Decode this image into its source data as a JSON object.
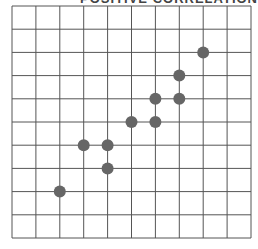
{
  "chart_data": {
    "type": "scatter",
    "title": "POSITIVE CORRELATION",
    "xlabel": "",
    "ylabel": "",
    "xlim": [
      0,
      10
    ],
    "ylim": [
      0,
      10
    ],
    "grid": true,
    "grid_divisions": 10,
    "points": [
      {
        "x": 2,
        "y": 2
      },
      {
        "x": 3,
        "y": 4
      },
      {
        "x": 4,
        "y": 4
      },
      {
        "x": 4,
        "y": 3
      },
      {
        "x": 5,
        "y": 5
      },
      {
        "x": 6,
        "y": 5
      },
      {
        "x": 6,
        "y": 6
      },
      {
        "x": 7,
        "y": 6
      },
      {
        "x": 7,
        "y": 7
      },
      {
        "x": 8,
        "y": 8
      }
    ],
    "colors": {
      "grid": "#555555",
      "point": "#666666",
      "background": "#ffffff"
    }
  }
}
